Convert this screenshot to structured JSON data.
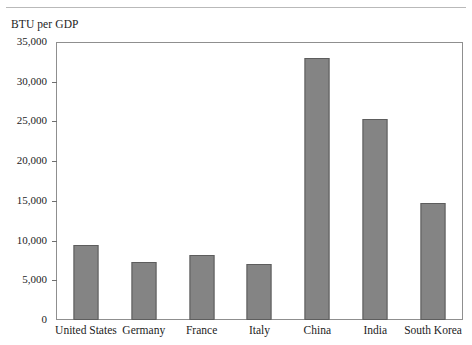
{
  "figure": {
    "axis_caption": "BTU per GDP",
    "bar_fill_color": "#848484",
    "bar_border_color": "#5d5d5d",
    "frame_color": "#8f8f8f",
    "text_color": "#1c1c1c"
  },
  "chart_data": {
    "type": "bar",
    "title": "",
    "subtitle": "",
    "xlabel": "",
    "ylabel": "BTU per GDP",
    "ylim": [
      0,
      35000
    ],
    "ytick_values": [
      0,
      5000,
      10000,
      15000,
      20000,
      25000,
      30000,
      35000
    ],
    "ytick_labels": [
      "0",
      "5,000",
      "10,000",
      "15,000",
      "20,000",
      "25,000",
      "30,000",
      "35,000"
    ],
    "grid": false,
    "legend": null,
    "categories": [
      "United States",
      "Germany",
      "France",
      "Italy",
      "China",
      "India",
      "South Korea"
    ],
    "values": [
      9500,
      7400,
      8200,
      7100,
      33200,
      25500,
      14800
    ],
    "series": [
      {
        "name": "BTU per GDP",
        "values": [
          9500,
          7400,
          8200,
          7100,
          33200,
          25500,
          14800
        ]
      }
    ]
  }
}
